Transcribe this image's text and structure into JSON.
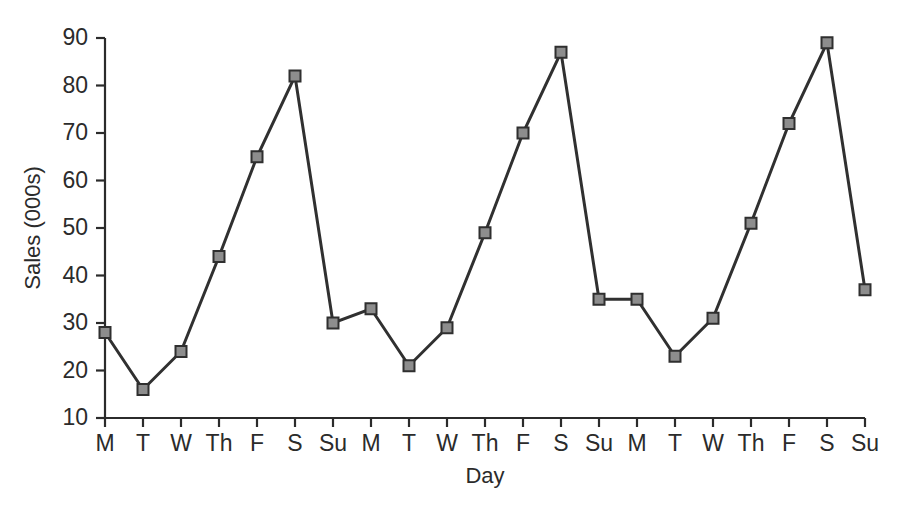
{
  "chart_data": {
    "type": "line",
    "title": "",
    "xlabel": "Day",
    "ylabel": "Sales (000s)",
    "categories": [
      "M",
      "T",
      "W",
      "Th",
      "F",
      "S",
      "Su",
      "M",
      "T",
      "W",
      "Th",
      "F",
      "S",
      "Su",
      "M",
      "T",
      "W",
      "Th",
      "F",
      "S",
      "Su"
    ],
    "values": [
      28,
      16,
      24,
      44,
      65,
      82,
      30,
      33,
      21,
      29,
      49,
      70,
      87,
      35,
      35,
      23,
      31,
      51,
      72,
      89,
      37
    ],
    "series": [
      {
        "name": "Sales",
        "values": [
          28,
          16,
          24,
          44,
          65,
          82,
          30,
          33,
          21,
          29,
          49,
          70,
          87,
          35,
          35,
          23,
          31,
          51,
          72,
          89,
          37
        ]
      }
    ],
    "ylim": [
      10,
      90
    ],
    "yticks": [
      10,
      20,
      30,
      40,
      50,
      60,
      70,
      80,
      90
    ],
    "ytick_labels": [
      "10",
      "20",
      "30",
      "40",
      "50",
      "60",
      "70",
      "80",
      "90"
    ],
    "grid": false,
    "legend": false,
    "legend_position": "none",
    "marker_style": "square",
    "marker_fill_color": "#8d8d8d",
    "marker_edge_color": "#2f2f2f",
    "line_color": "#303030",
    "axis_color": "#2b2b2b",
    "background_color": "#ffffff"
  },
  "axes": {
    "y_label": "Sales (000s)",
    "x_label": "Day"
  }
}
